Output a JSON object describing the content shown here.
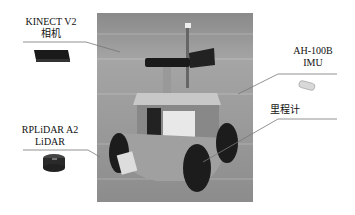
{
  "diagram": {
    "components": [
      {
        "id": "kinect",
        "label_line1": "KINECT V2",
        "label_line2": "相机",
        "side": "left"
      },
      {
        "id": "imu",
        "label_line1": "AH-100B",
        "label_line2": "IMU",
        "side": "right"
      },
      {
        "id": "odometer",
        "label_line1": "里程计",
        "label_line2": "",
        "side": "right"
      },
      {
        "id": "lidar",
        "label_line1": "RPLiDAR A2",
        "label_line2": "LiDAR",
        "side": "left"
      }
    ],
    "colors": {
      "background": "#ffffff",
      "leader_line": "#777777",
      "text": "#111111"
    }
  }
}
